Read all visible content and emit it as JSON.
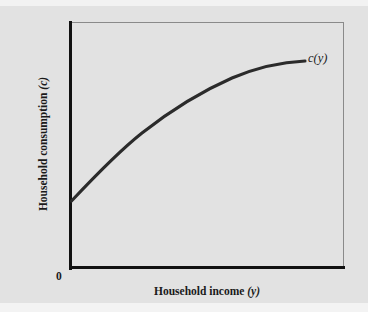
{
  "figure": {
    "background_color": "#e2e2e2",
    "frame_color": "#8a8a8a",
    "axis_color": "#111111",
    "curve_color": "#2b2b2b"
  },
  "labels": {
    "y_axis": "Household consumption (c)",
    "x_axis": "Household income (y)",
    "curve": "c(y)",
    "origin": "0"
  },
  "chart_data": {
    "type": "line",
    "title": "",
    "xlabel": "Household income (y)",
    "ylabel": "Household consumption (c)",
    "xlim": [
      0,
      100
    ],
    "ylim": [
      0,
      100
    ],
    "grid": false,
    "legend": "none",
    "annotations": [
      {
        "text": "c(y)",
        "x": 87,
        "y": 84,
        "style": "italic",
        "placement": "curve-end-right"
      },
      {
        "text": "0",
        "x": 0,
        "y": 0,
        "placement": "below-left-of-origin"
      }
    ],
    "axis_ticks": {
      "x": [],
      "y": []
    },
    "series": [
      {
        "name": "c(y)",
        "description": "Concave consumption function: positive intercept, positive but diminishing slope (marginal propensity to consume between 0 and 1, declining with income).",
        "x": [
          0,
          5,
          10,
          15,
          20,
          25,
          30,
          35,
          40,
          45,
          50,
          55,
          60,
          65,
          70,
          75,
          80,
          85,
          87
        ],
        "y": [
          27,
          34,
          40,
          46,
          51,
          56,
          60,
          64,
          68,
          71,
          74,
          76,
          78,
          80,
          81.5,
          82.8,
          83.8,
          84.4,
          84.6
        ]
      }
    ]
  }
}
